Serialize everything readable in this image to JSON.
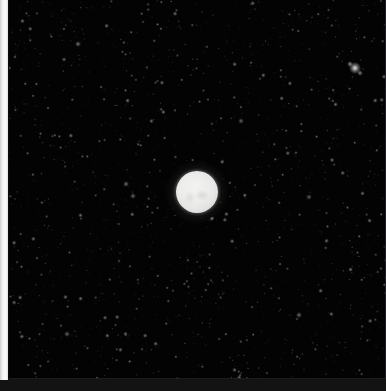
{
  "image": {
    "kind": "astronomical-observation",
    "width": 386,
    "height": 391,
    "background_color": "#030303",
    "frame_color": "#131313",
    "left_border_color": "#fbfbf9",
    "description_text": ""
  },
  "frame": {
    "x": 9,
    "y": 0,
    "width": 377,
    "height": 379,
    "edge_color": "#26262a"
  },
  "left_strip": {
    "x": 0,
    "y": 0,
    "width": 8,
    "height": 380,
    "color": "#fbfbf9"
  },
  "bottom_strip": {
    "x": 0,
    "y": 379,
    "width": 386,
    "height": 12,
    "color": "#131313"
  },
  "primary_object": {
    "label": "",
    "shape": "disc",
    "center_x": 196,
    "center_y": 191,
    "diameter": 42,
    "core_color": "#f2f2f0",
    "limb_color": "#8f8f8d",
    "halo_color": "#d2d2d0",
    "has_striping": true
  },
  "bright_stars": [
    {
      "x": 355,
      "y": 68,
      "size": 4,
      "brightness": 0.95,
      "color": "#e8e8e6"
    },
    {
      "x": 350,
      "y": 64,
      "size": 2,
      "brightness": 0.62,
      "color": "#c8c8c6"
    },
    {
      "x": 360,
      "y": 73,
      "size": 2,
      "brightness": 0.55,
      "color": "#bcbcba"
    },
    {
      "x": 126,
      "y": 184,
      "size": 2,
      "brightness": 0.48,
      "color": "#b0b0ae"
    },
    {
      "x": 133,
      "y": 196,
      "size": 2,
      "brightness": 0.45,
      "color": "#aaaaa8"
    },
    {
      "x": 78,
      "y": 44,
      "size": 2,
      "brightness": 0.5,
      "color": "#b4b4b2"
    },
    {
      "x": 299,
      "y": 315,
      "size": 2,
      "brightness": 0.47,
      "color": "#aeaeac"
    },
    {
      "x": 241,
      "y": 121,
      "size": 2,
      "brightness": 0.42,
      "color": "#a6a6a4"
    },
    {
      "x": 67,
      "y": 334,
      "size": 2,
      "brightness": 0.44,
      "color": "#a8a8a6"
    },
    {
      "x": 309,
      "y": 197,
      "size": 2,
      "brightness": 0.4,
      "color": "#a2a2a0"
    }
  ],
  "starfield": {
    "count": 1400,
    "seed": 20240517,
    "min_brightness": 0.06,
    "max_brightness": 0.55,
    "color": "#dcdcda"
  },
  "chart_data": {
    "type": "scatter",
    "title": "",
    "xlabel": "",
    "ylabel": "",
    "xlim": [
      0,
      386
    ],
    "ylim": [
      0,
      391
    ],
    "grid": false,
    "legend": null,
    "series": [
      {
        "name": "resolved-source",
        "values": [
          {
            "x": 196,
            "y": 191,
            "radius": 21,
            "flux": 1.0
          }
        ]
      },
      {
        "name": "field-stars",
        "values": [
          {
            "x": 355,
            "y": 68,
            "radius": 2,
            "flux": 0.95
          },
          {
            "x": 350,
            "y": 64,
            "radius": 1,
            "flux": 0.62
          },
          {
            "x": 360,
            "y": 73,
            "radius": 1,
            "flux": 0.55
          },
          {
            "x": 126,
            "y": 184,
            "radius": 1,
            "flux": 0.48
          },
          {
            "x": 133,
            "y": 196,
            "radius": 1,
            "flux": 0.45
          },
          {
            "x": 78,
            "y": 44,
            "radius": 1,
            "flux": 0.5
          },
          {
            "x": 299,
            "y": 315,
            "radius": 1,
            "flux": 0.47
          },
          {
            "x": 241,
            "y": 121,
            "radius": 1,
            "flux": 0.42
          },
          {
            "x": 67,
            "y": 334,
            "radius": 1,
            "flux": 0.44
          },
          {
            "x": 309,
            "y": 197,
            "radius": 1,
            "flux": 0.4
          }
        ]
      }
    ]
  }
}
